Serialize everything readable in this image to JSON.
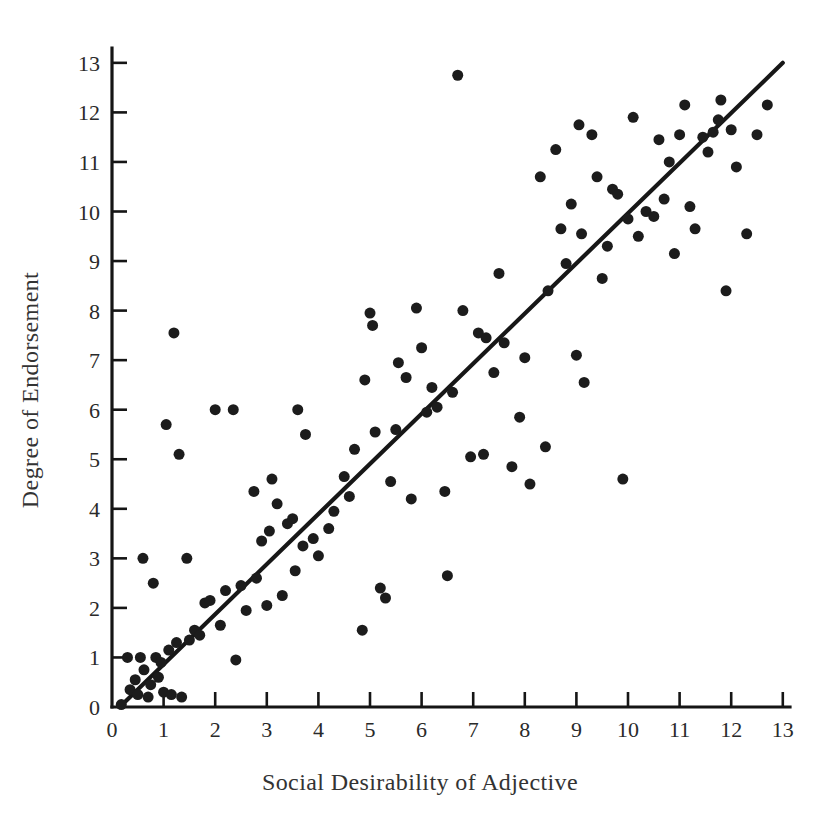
{
  "chart_data": {
    "type": "scatter",
    "title": "",
    "xlabel": "Social Desirability of Adjective",
    "ylabel": "Degree of Endorsement",
    "xlim": [
      0,
      13.4
    ],
    "ylim": [
      0,
      13.3
    ],
    "xticks": [
      0,
      1,
      2,
      3,
      4,
      5,
      6,
      7,
      8,
      9,
      10,
      11,
      12,
      13
    ],
    "yticks": [
      0,
      1,
      2,
      3,
      4,
      5,
      6,
      7,
      8,
      9,
      10,
      11,
      12,
      13
    ],
    "xtick_labels": [
      "0",
      "1",
      "2",
      "3",
      "4",
      "5",
      "6",
      "7",
      "8",
      "9",
      "10",
      "11",
      "12",
      "13"
    ],
    "ytick_labels": [
      "0",
      "1",
      "2",
      "3",
      "4",
      "5",
      "6",
      "7",
      "8",
      "9",
      "10",
      "11",
      "12",
      "13"
    ],
    "grid": false,
    "legend": false,
    "tick_direction": "in",
    "marker_color": "#1c1c1c",
    "marker_size_px": 11,
    "line_color": "#171717",
    "background_color": "#ffffff",
    "fit_line": {
      "name": "regression line",
      "x": [
        0.15,
        13.0
      ],
      "y": [
        0.0,
        13.0
      ]
    },
    "points": [
      [
        0.18,
        0.05
      ],
      [
        0.3,
        1.0
      ],
      [
        0.35,
        0.35
      ],
      [
        0.45,
        0.55
      ],
      [
        0.5,
        0.25
      ],
      [
        0.55,
        1.0
      ],
      [
        0.6,
        3.0
      ],
      [
        0.62,
        0.75
      ],
      [
        0.7,
        0.2
      ],
      [
        0.75,
        0.45
      ],
      [
        0.8,
        2.5
      ],
      [
        0.85,
        1.0
      ],
      [
        0.9,
        0.6
      ],
      [
        0.95,
        0.9
      ],
      [
        1.0,
        0.3
      ],
      [
        1.05,
        5.7
      ],
      [
        1.1,
        1.15
      ],
      [
        1.15,
        0.25
      ],
      [
        1.2,
        7.55
      ],
      [
        1.25,
        1.3
      ],
      [
        1.3,
        5.1
      ],
      [
        1.35,
        0.2
      ],
      [
        1.45,
        3.0
      ],
      [
        1.5,
        1.35
      ],
      [
        1.6,
        1.55
      ],
      [
        1.7,
        1.45
      ],
      [
        1.8,
        2.1
      ],
      [
        1.9,
        2.15
      ],
      [
        2.0,
        6.0
      ],
      [
        2.1,
        1.65
      ],
      [
        2.2,
        2.35
      ],
      [
        2.35,
        6.0
      ],
      [
        2.4,
        0.95
      ],
      [
        2.5,
        2.45
      ],
      [
        2.6,
        1.95
      ],
      [
        2.75,
        4.35
      ],
      [
        2.8,
        2.6
      ],
      [
        2.9,
        3.35
      ],
      [
        3.0,
        2.05
      ],
      [
        3.05,
        3.55
      ],
      [
        3.1,
        4.6
      ],
      [
        3.2,
        4.1
      ],
      [
        3.3,
        2.25
      ],
      [
        3.4,
        3.7
      ],
      [
        3.5,
        3.8
      ],
      [
        3.55,
        2.75
      ],
      [
        3.6,
        6.0
      ],
      [
        3.7,
        3.25
      ],
      [
        3.75,
        5.5
      ],
      [
        3.9,
        3.4
      ],
      [
        4.0,
        3.05
      ],
      [
        4.2,
        3.6
      ],
      [
        4.3,
        3.95
      ],
      [
        4.5,
        4.65
      ],
      [
        4.6,
        4.25
      ],
      [
        4.7,
        5.2
      ],
      [
        4.85,
        1.55
      ],
      [
        4.9,
        6.6
      ],
      [
        5.0,
        7.95
      ],
      [
        5.05,
        7.7
      ],
      [
        5.1,
        5.55
      ],
      [
        5.2,
        2.4
      ],
      [
        5.3,
        2.2
      ],
      [
        5.4,
        4.55
      ],
      [
        5.5,
        5.6
      ],
      [
        5.55,
        6.95
      ],
      [
        5.7,
        6.65
      ],
      [
        5.8,
        4.2
      ],
      [
        5.9,
        8.05
      ],
      [
        6.0,
        7.25
      ],
      [
        6.1,
        5.95
      ],
      [
        6.2,
        6.45
      ],
      [
        6.3,
        6.05
      ],
      [
        6.45,
        4.35
      ],
      [
        6.5,
        2.65
      ],
      [
        6.6,
        6.35
      ],
      [
        6.7,
        12.75
      ],
      [
        6.8,
        8.0
      ],
      [
        6.95,
        5.05
      ],
      [
        7.1,
        7.55
      ],
      [
        7.2,
        5.1
      ],
      [
        7.25,
        7.45
      ],
      [
        7.4,
        6.75
      ],
      [
        7.5,
        8.75
      ],
      [
        7.6,
        7.35
      ],
      [
        7.75,
        4.85
      ],
      [
        7.9,
        5.85
      ],
      [
        8.0,
        7.05
      ],
      [
        8.1,
        4.5
      ],
      [
        8.3,
        10.7
      ],
      [
        8.4,
        5.25
      ],
      [
        8.45,
        8.4
      ],
      [
        8.6,
        11.25
      ],
      [
        8.7,
        9.65
      ],
      [
        8.8,
        8.95
      ],
      [
        8.9,
        10.15
      ],
      [
        9.0,
        7.1
      ],
      [
        9.05,
        11.75
      ],
      [
        9.1,
        9.55
      ],
      [
        9.15,
        6.55
      ],
      [
        9.3,
        11.55
      ],
      [
        9.4,
        10.7
      ],
      [
        9.5,
        8.65
      ],
      [
        9.6,
        9.3
      ],
      [
        9.7,
        10.45
      ],
      [
        9.8,
        10.35
      ],
      [
        9.9,
        4.6
      ],
      [
        10.0,
        9.85
      ],
      [
        10.1,
        11.9
      ],
      [
        10.2,
        9.5
      ],
      [
        10.35,
        10.0
      ],
      [
        10.5,
        9.9
      ],
      [
        10.6,
        11.45
      ],
      [
        10.7,
        10.25
      ],
      [
        10.8,
        11.0
      ],
      [
        10.9,
        9.15
      ],
      [
        11.0,
        11.55
      ],
      [
        11.1,
        12.15
      ],
      [
        11.2,
        10.1
      ],
      [
        11.3,
        9.65
      ],
      [
        11.45,
        11.5
      ],
      [
        11.55,
        11.2
      ],
      [
        11.65,
        11.6
      ],
      [
        11.75,
        11.85
      ],
      [
        11.8,
        12.25
      ],
      [
        11.9,
        8.4
      ],
      [
        12.0,
        11.65
      ],
      [
        12.1,
        10.9
      ],
      [
        12.3,
        9.55
      ],
      [
        12.5,
        11.55
      ],
      [
        12.7,
        12.15
      ]
    ]
  }
}
